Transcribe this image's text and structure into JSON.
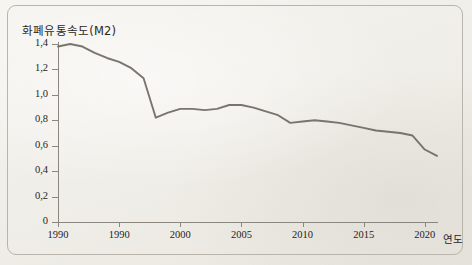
{
  "figure": {
    "background_color": "#f3f1ec",
    "border_color": "#b9b5ad",
    "line_color": "#6f6b64",
    "axis_color": "#8b877f",
    "text_color": "#26231e"
  },
  "axis": {
    "y_title": "화폐유통속도(M2)",
    "x_title": "연도",
    "y_ticks": [
      "1,4",
      "1,2",
      "1,0",
      "0,8",
      "0,6",
      "0,4",
      "0,2",
      "0"
    ],
    "y_tick_values": [
      1.4,
      1.2,
      1.0,
      0.8,
      0.6,
      0.4,
      0.2,
      0
    ],
    "x_ticks": [
      "1990",
      "1990",
      "2000",
      "2005",
      "2010",
      "2015",
      "2020"
    ],
    "x_tick_values": [
      1990,
      1995,
      2000,
      2005,
      2010,
      2015,
      2020
    ]
  },
  "chart_data": {
    "type": "line",
    "title": "화폐유통속도(M2)",
    "xlabel": "연도",
    "ylabel": "화폐유통속도(M2)",
    "xlim": [
      1990,
      2021
    ],
    "ylim": [
      0,
      1.4
    ],
    "grid": false,
    "legend": null,
    "x_tick_labels": [
      "1990",
      "1990",
      "2000",
      "2005",
      "2010",
      "2015",
      "2020"
    ],
    "y_tick_labels": [
      "0",
      "0,2",
      "0,4",
      "0,6",
      "0,8",
      "1,0",
      "1,2",
      "1,4"
    ],
    "series": [
      {
        "name": "화폐유통속도(M2)",
        "x": [
          1990,
          1991,
          1992,
          1993,
          1994,
          1995,
          1996,
          1997,
          1998,
          1999,
          2000,
          2001,
          2002,
          2003,
          2004,
          2005,
          2006,
          2007,
          2008,
          2009,
          2010,
          2011,
          2012,
          2013,
          2014,
          2015,
          2016,
          2017,
          2018,
          2019,
          2020,
          2021
        ],
        "values": [
          1.38,
          1.4,
          1.38,
          1.33,
          1.29,
          1.26,
          1.21,
          1.13,
          0.82,
          0.86,
          0.89,
          0.89,
          0.88,
          0.89,
          0.92,
          0.92,
          0.9,
          0.87,
          0.84,
          0.78,
          0.79,
          0.8,
          0.79,
          0.78,
          0.76,
          0.74,
          0.72,
          0.71,
          0.7,
          0.68,
          0.57,
          0.52
        ]
      }
    ],
    "annotations": [
      {
        "note": "sharp drop between 1997 and 1998"
      },
      {
        "note": "local peak around 2004-2005"
      },
      {
        "note": "steep decline 2019 to 2021"
      }
    ]
  }
}
